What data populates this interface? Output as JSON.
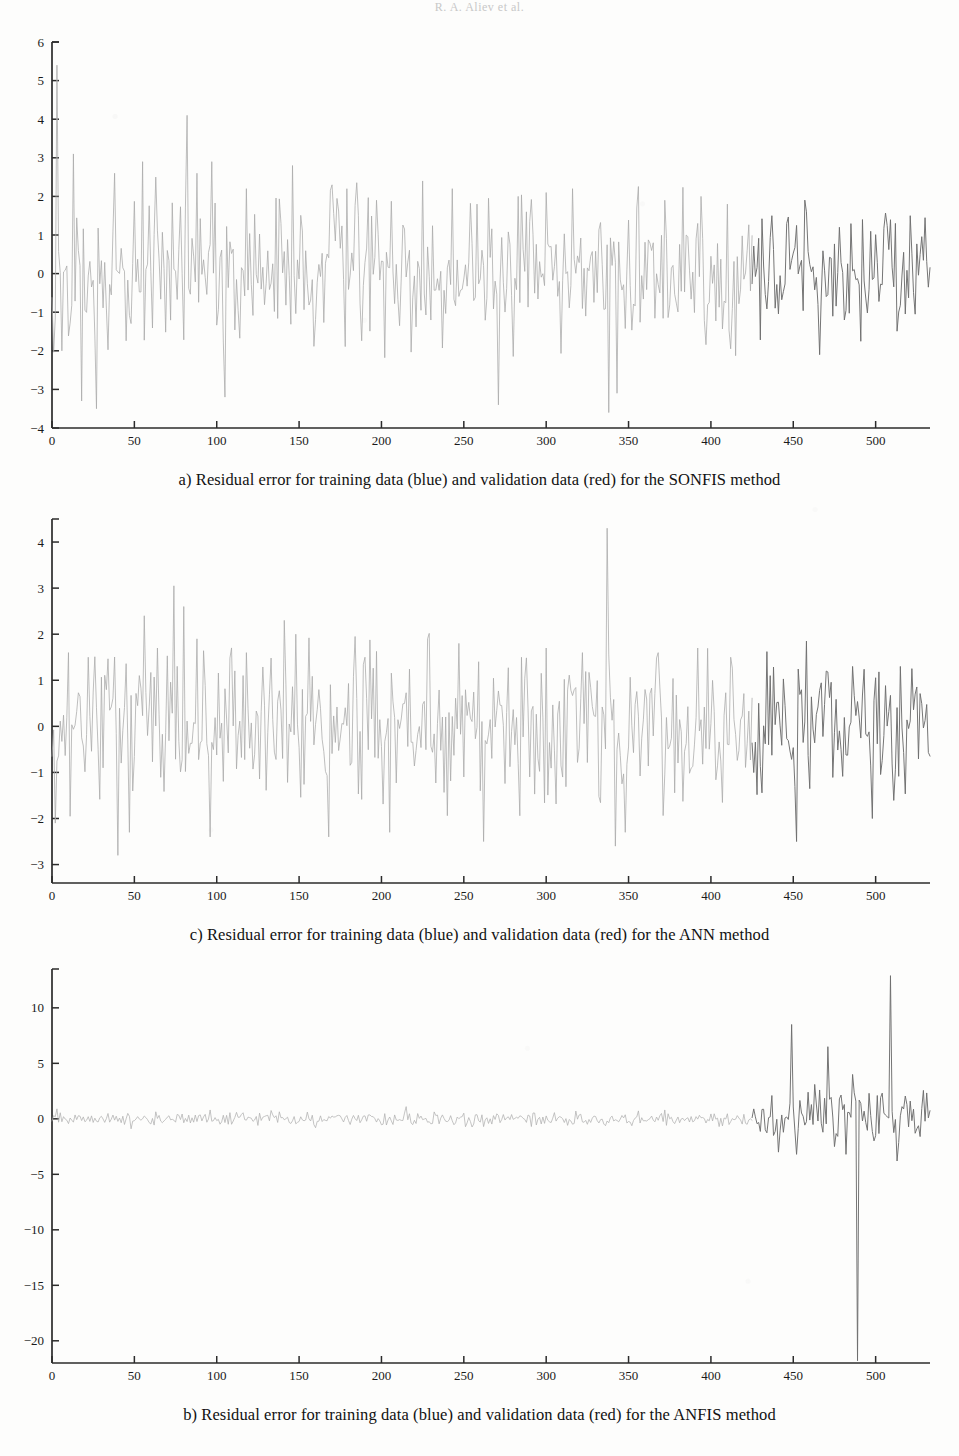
{
  "page": {
    "running_head": "R. A. Aliev et al.",
    "background_color": "#fdfdfc",
    "width": 959,
    "height": 1456
  },
  "figure": {
    "panels": [
      {
        "id": "panel-a",
        "caption": "a) Residual error for training data (blue) and validation data (red) for the SONFIS method",
        "chart_index": 0
      },
      {
        "id": "panel-c",
        "caption": "c) Residual error for training data (blue) and validation data (red) for the ANN method",
        "chart_index": 1
      },
      {
        "id": "panel-b",
        "caption": "b) Residual error for training data (blue) and validation data (red) for the ANFIS method",
        "chart_index": 2
      }
    ]
  },
  "chart_data": [
    {
      "type": "line",
      "title": "a) Residual error for training data (blue) and validation data (red) for the SONFIS method",
      "xlabel": "",
      "ylabel": "",
      "xlim": [
        0,
        533
      ],
      "ylim": [
        -4,
        6
      ],
      "xticks": [
        0,
        50,
        100,
        150,
        200,
        250,
        300,
        350,
        400,
        450,
        500
      ],
      "yticks": [
        -4,
        -3,
        -2,
        -1,
        0,
        1,
        2,
        3,
        4,
        5,
        6
      ],
      "grid": false,
      "legend_position": "none",
      "split_index": 425,
      "series": [
        {
          "name": "training data (blue)",
          "color": "#a8a8a8",
          "x_start": 0,
          "x_end": 425,
          "noise_sigma": 0.95,
          "seed": 1703,
          "spikes": [
            {
              "x": 3,
              "y": 5.4
            },
            {
              "x": 6,
              "y": -2.0
            },
            {
              "x": 13,
              "y": 3.1
            },
            {
              "x": 18,
              "y": -3.3
            },
            {
              "x": 27,
              "y": -3.5
            },
            {
              "x": 38,
              "y": 2.6
            },
            {
              "x": 55,
              "y": 2.9
            },
            {
              "x": 63,
              "y": 2.5
            },
            {
              "x": 82,
              "y": 4.1
            },
            {
              "x": 88,
              "y": 2.6
            },
            {
              "x": 97,
              "y": 2.9
            },
            {
              "x": 105,
              "y": -3.2
            },
            {
              "x": 118,
              "y": 2.2
            },
            {
              "x": 146,
              "y": 2.8
            },
            {
              "x": 170,
              "y": 2.3
            },
            {
              "x": 197,
              "y": 1.9
            },
            {
              "x": 225,
              "y": 2.4
            },
            {
              "x": 243,
              "y": 2.2
            },
            {
              "x": 258,
              "y": 1.8
            },
            {
              "x": 271,
              "y": -3.4
            },
            {
              "x": 283,
              "y": 2.0
            },
            {
              "x": 300,
              "y": 2.1
            },
            {
              "x": 316,
              "y": 2.2
            },
            {
              "x": 338,
              "y": -3.6
            },
            {
              "x": 343,
              "y": -3.1
            },
            {
              "x": 355,
              "y": 1.7
            },
            {
              "x": 372,
              "y": 1.9
            },
            {
              "x": 394,
              "y": 2.0
            },
            {
              "x": 410,
              "y": 1.8
            }
          ]
        },
        {
          "name": "validation data (red)",
          "color": "#6e6e6e",
          "x_start": 425,
          "x_end": 533,
          "noise_sigma": 0.85,
          "seed": 9211,
          "spikes": [
            {
              "x": 437,
              "y": 1.5
            },
            {
              "x": 446,
              "y": 1.3
            },
            {
              "x": 458,
              "y": 1.6
            },
            {
              "x": 466,
              "y": -2.1
            },
            {
              "x": 478,
              "y": 1.2
            },
            {
              "x": 492,
              "y": 1.4
            },
            {
              "x": 512,
              "y": 1.3
            },
            {
              "x": 521,
              "y": 1.5
            }
          ]
        }
      ]
    },
    {
      "type": "line",
      "title": "c) Residual error for training data (blue) and validation data (red) for the ANN method",
      "xlabel": "",
      "ylabel": "",
      "xlim": [
        0,
        533
      ],
      "ylim": [
        -3.4,
        4.5
      ],
      "xticks": [
        0,
        50,
        100,
        150,
        200,
        250,
        300,
        350,
        400,
        450,
        500
      ],
      "yticks": [
        -3,
        -2,
        -1,
        0,
        1,
        2,
        3,
        4
      ],
      "grid": false,
      "legend_position": "none",
      "split_index": 425,
      "series": [
        {
          "name": "training data (blue)",
          "color": "#a8a8a8",
          "x_start": 0,
          "x_end": 425,
          "noise_sigma": 0.78,
          "seed": 4457,
          "spikes": [
            {
              "x": 2,
              "y": -2.1
            },
            {
              "x": 10,
              "y": 1.6
            },
            {
              "x": 22,
              "y": 1.5
            },
            {
              "x": 40,
              "y": -2.8
            },
            {
              "x": 47,
              "y": -2.3
            },
            {
              "x": 56,
              "y": 2.4
            },
            {
              "x": 64,
              "y": 1.7
            },
            {
              "x": 74,
              "y": 3.05
            },
            {
              "x": 80,
              "y": 2.6
            },
            {
              "x": 88,
              "y": 1.9
            },
            {
              "x": 96,
              "y": -2.4
            },
            {
              "x": 118,
              "y": 1.6
            },
            {
              "x": 141,
              "y": 2.3
            },
            {
              "x": 148,
              "y": 2.0
            },
            {
              "x": 168,
              "y": -2.4
            },
            {
              "x": 190,
              "y": 1.5
            },
            {
              "x": 205,
              "y": -2.3
            },
            {
              "x": 228,
              "y": 1.9
            },
            {
              "x": 247,
              "y": 1.8
            },
            {
              "x": 262,
              "y": -2.5
            },
            {
              "x": 285,
              "y": 1.5
            },
            {
              "x": 300,
              "y": 1.7
            },
            {
              "x": 322,
              "y": 1.6
            },
            {
              "x": 337,
              "y": 4.3
            },
            {
              "x": 342,
              "y": -2.6
            },
            {
              "x": 348,
              "y": -2.3
            },
            {
              "x": 368,
              "y": 1.6
            },
            {
              "x": 392,
              "y": 1.7
            },
            {
              "x": 412,
              "y": 1.5
            }
          ]
        },
        {
          "name": "validation data (red)",
          "color": "#6e6e6e",
          "x_start": 425,
          "x_end": 533,
          "noise_sigma": 0.72,
          "seed": 8123,
          "spikes": [
            {
              "x": 436,
              "y": 1.1
            },
            {
              "x": 452,
              "y": -2.5
            },
            {
              "x": 458,
              "y": 1.85
            },
            {
              "x": 470,
              "y": 1.2
            },
            {
              "x": 486,
              "y": 1.3
            },
            {
              "x": 498,
              "y": -2.0
            },
            {
              "x": 515,
              "y": 1.3
            },
            {
              "x": 524,
              "y": 0.7
            }
          ]
        }
      ]
    },
    {
      "type": "line",
      "title": "b) Residual error for training data (blue) and validation data (red) for the ANFIS method",
      "xlabel": "",
      "ylabel": "",
      "xlim": [
        0,
        533
      ],
      "ylim": [
        -22,
        13.5
      ],
      "xticks": [
        0,
        50,
        100,
        150,
        200,
        250,
        300,
        350,
        400,
        450,
        500
      ],
      "yticks": [
        -20,
        -15,
        -10,
        -5,
        0,
        5,
        10
      ],
      "grid": false,
      "legend_position": "none",
      "split_index": 425,
      "series": [
        {
          "name": "training data (blue)",
          "color": "#b0b0b0",
          "x_start": 0,
          "x_end": 425,
          "noise_sigma": 0.3,
          "seed": 2291,
          "spikes": [
            {
              "x": 3,
              "y": 0.9
            },
            {
              "x": 48,
              "y": -0.9
            },
            {
              "x": 96,
              "y": 0.8
            },
            {
              "x": 133,
              "y": 0.75
            },
            {
              "x": 160,
              "y": -0.8
            },
            {
              "x": 215,
              "y": 1.1
            },
            {
              "x": 262,
              "y": -0.7
            },
            {
              "x": 318,
              "y": 0.7
            },
            {
              "x": 372,
              "y": 0.8
            },
            {
              "x": 405,
              "y": -0.7
            }
          ]
        },
        {
          "name": "validation data (red)",
          "color": "#6e6e6e",
          "x_start": 425,
          "x_end": 533,
          "noise_sigma": 1.25,
          "seed": 6607,
          "spikes": [
            {
              "x": 437,
              "y": 2.1
            },
            {
              "x": 441,
              "y": -3.0
            },
            {
              "x": 449,
              "y": 8.5
            },
            {
              "x": 452,
              "y": -3.2
            },
            {
              "x": 459,
              "y": 2.4
            },
            {
              "x": 463,
              "y": 3.1
            },
            {
              "x": 466,
              "y": 2.6
            },
            {
              "x": 471,
              "y": 6.5
            },
            {
              "x": 475,
              "y": -2.5
            },
            {
              "x": 486,
              "y": 4.0
            },
            {
              "x": 489,
              "y": -21.8
            },
            {
              "x": 496,
              "y": 2.3
            },
            {
              "x": 501,
              "y": 2.1
            },
            {
              "x": 509,
              "y": 12.9
            },
            {
              "x": 513,
              "y": -3.8
            },
            {
              "x": 521,
              "y": 1.6
            },
            {
              "x": 527,
              "y": -1.6
            }
          ]
        }
      ]
    }
  ],
  "axis_style": {
    "line_color": "#2b2b2b",
    "tick_label_size": 13,
    "tick_label_color": "#1a1a1a"
  }
}
